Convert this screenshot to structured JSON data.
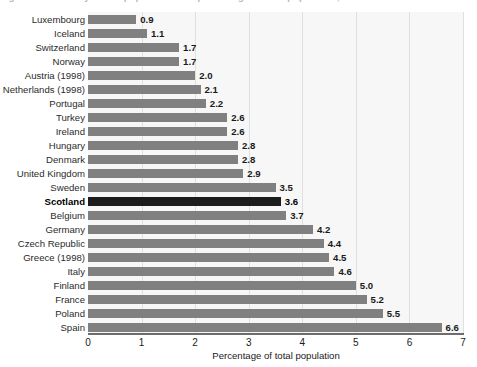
{
  "title_fragment": "Figure 1.3: Minority ethnic population as a percentage of total population, selected countries",
  "chart_data": {
    "type": "bar",
    "orientation": "horizontal",
    "title": "",
    "xlabel": "Percentage of total population",
    "ylabel": "",
    "xlim": [
      0,
      7
    ],
    "xticks": [
      0,
      1,
      2,
      3,
      4,
      5,
      6,
      7
    ],
    "xtick_labels": [
      "0",
      "1",
      "2",
      "3",
      "4",
      "5",
      "6",
      "7"
    ],
    "grid": true,
    "grid_axis": "x",
    "legend": "none",
    "bar_color": "#808080",
    "highlight_color": "#1c1c1c",
    "highlight_category": "Scotland",
    "categories": [
      "Luxembourg",
      "Iceland",
      "Switzerland",
      "Norway",
      "Austria (1998)",
      "Netherlands (1998)",
      "Portugal",
      "Turkey",
      "Ireland",
      "Hungary",
      "Denmark",
      "United Kingdom",
      "Sweden",
      "Scotland",
      "Belgium",
      "Germany",
      "Czech Republic",
      "Greece (1998)",
      "Italy",
      "Finland",
      "France",
      "Poland",
      "Spain"
    ],
    "values": [
      0.9,
      1.1,
      1.7,
      1.7,
      2.0,
      2.1,
      2.2,
      2.6,
      2.6,
      2.8,
      2.8,
      2.9,
      3.5,
      3.6,
      3.7,
      4.2,
      4.4,
      4.5,
      4.6,
      5.0,
      5.2,
      5.5,
      6.6
    ],
    "value_labels": [
      "0.9",
      "1.1",
      "1.7",
      "1.7",
      "2.0",
      "2.1",
      "2.2",
      "2.6",
      "2.6",
      "2.8",
      "2.8",
      "2.9",
      "3.5",
      "3.6",
      "3.7",
      "4.2",
      "4.4",
      "4.5",
      "4.6",
      "5.0",
      "5.2",
      "5.5",
      "6.6"
    ]
  }
}
